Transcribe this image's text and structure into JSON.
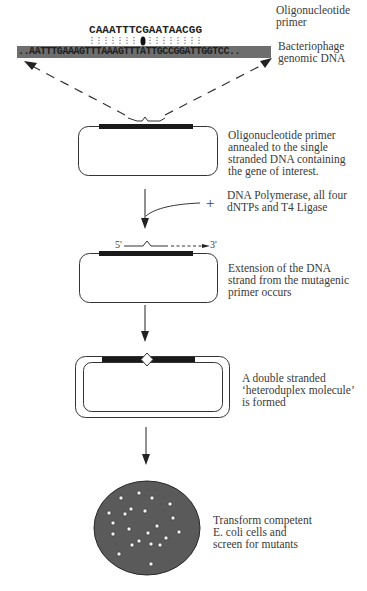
{
  "primer": {
    "sequence": "CAAATTTCGAATAACGG",
    "label_line1": "Oligonucleotide",
    "label_line2": "primer"
  },
  "genomic_dna": {
    "sequence": "..AATTTGAAAGTTTAAAGTTTATTGCCGGATTGGTCC..",
    "label_line1": "Bacteriophage",
    "label_line2": "genomic DNA",
    "bar_color": "#6e6e6e"
  },
  "steps": [
    {
      "id": "annealing",
      "lines": [
        "Oligonucleotide primer",
        "annealed to the single",
        "stranded DNA containing",
        "the gene of interest."
      ]
    },
    {
      "id": "reagents",
      "symbol": "+",
      "lines": [
        "DNA Polymerase, all four",
        "dNTPs and T4 Ligase"
      ]
    },
    {
      "id": "extension",
      "five_prime": "5'",
      "three_prime": "3'",
      "lines": [
        "Extension of the DNA",
        "strand from the mutagenic",
        "primer occurs"
      ]
    },
    {
      "id": "heteroduplex",
      "lines": [
        "A double stranded",
        "‘heteroduplex molecule’",
        "is formed"
      ]
    },
    {
      "id": "transform",
      "lines": [
        "Transform competent",
        "E. coli cells and",
        "screen for mutants"
      ]
    }
  ],
  "colors": {
    "plate_fill": "#5a5a5a",
    "colony": "#f2f2f2",
    "line": "#333333"
  }
}
